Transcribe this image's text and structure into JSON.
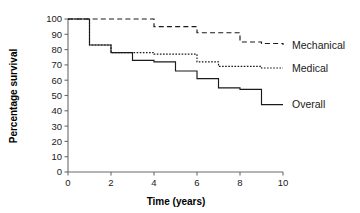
{
  "chart_data": {
    "type": "line",
    "title": "",
    "subtitle": "",
    "xlabel": "Time (years)",
    "ylabel": "Percentage survival",
    "xlim": [
      0,
      10
    ],
    "ylim": [
      0,
      100
    ],
    "xticks": [
      0,
      2,
      4,
      6,
      8,
      10
    ],
    "xtick_labels": [
      "0",
      "2",
      "4",
      "6",
      "8",
      "10"
    ],
    "yticks": [
      0,
      10,
      20,
      30,
      40,
      50,
      60,
      70,
      80,
      90,
      100
    ],
    "ytick_labels": [
      "0",
      "10",
      "20",
      "30",
      "40",
      "50",
      "60",
      "70",
      "80",
      "90",
      "100"
    ],
    "grid": false,
    "legend_position": "right-inline",
    "step_style": "post",
    "series": [
      {
        "name": "Mechanical",
        "line_style": "dashed",
        "color": "#1a1a1a",
        "x": [
          0,
          1,
          2,
          3,
          4,
          5,
          6,
          7,
          8,
          9,
          10
        ],
        "values": [
          100,
          100,
          100,
          100,
          95,
          95,
          91,
          91,
          85,
          84,
          83
        ]
      },
      {
        "name": "Medical",
        "line_style": "dotted",
        "color": "#1a1a1a",
        "x": [
          0,
          1,
          2,
          3,
          4,
          5,
          6,
          7,
          8,
          9,
          10
        ],
        "values": [
          100,
          83,
          78,
          78,
          77,
          77,
          72,
          69,
          69,
          68,
          68
        ]
      },
      {
        "name": "Overall",
        "line_style": "solid",
        "color": "#1a1a1a",
        "x": [
          0,
          1,
          2,
          3,
          4,
          5,
          6,
          7,
          8,
          9,
          10
        ],
        "values": [
          100,
          83,
          78,
          73,
          72,
          66,
          61,
          55,
          54,
          44,
          44
        ]
      }
    ],
    "legend": [
      {
        "label": "Mechanical",
        "line_style": "dashed"
      },
      {
        "label": "Medical",
        "line_style": "dotted"
      },
      {
        "label": "Overall",
        "line_style": "solid"
      }
    ]
  }
}
